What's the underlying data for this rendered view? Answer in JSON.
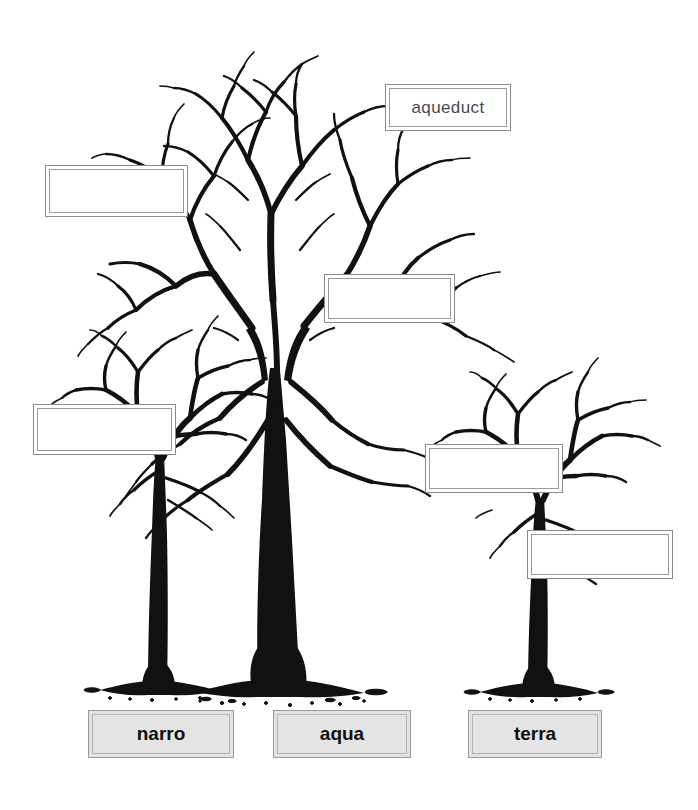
{
  "page": {
    "background_color": "#ffffff",
    "width": 698,
    "height": 810
  },
  "colors": {
    "tree_ink": "#111111",
    "box_border": "#8b8b8b",
    "box_inner_border": "#9a9a9a",
    "box_fill": "#ffffff",
    "root_box_fill": "#e2e2e2",
    "root_box_border": "#9a9a9a",
    "filled_text": "#4a4a4a",
    "root_text": "#101010"
  },
  "trees": [
    {
      "id": "tree-narro",
      "name": "narro-tree",
      "root_word": "narro",
      "size": "small",
      "position": "left"
    },
    {
      "id": "tree-aqua",
      "name": "aqua-tree",
      "root_word": "aqua",
      "size": "large",
      "position": "center"
    },
    {
      "id": "tree-terra",
      "name": "terra-tree",
      "root_word": "terra",
      "size": "small",
      "position": "right"
    }
  ],
  "root_labels": [
    {
      "id": "root-narro",
      "text": "narro",
      "x": 88,
      "y": 710,
      "w": 146,
      "h": 48
    },
    {
      "id": "root-aqua",
      "text": "aqua",
      "x": 273,
      "y": 710,
      "w": 138,
      "h": 48
    },
    {
      "id": "root-terra",
      "text": "terra",
      "x": 468,
      "y": 710,
      "w": 134,
      "h": 48
    }
  ],
  "word_boxes": [
    {
      "id": "word-box-aqueduct",
      "name": "word-box-aqueduct",
      "text": "aqueduct",
      "filled": true,
      "tree": "aqua",
      "x": 385,
      "y": 84,
      "w": 126,
      "h": 47
    },
    {
      "id": "word-box-2",
      "name": "word-box-empty-upper-left",
      "text": "",
      "filled": false,
      "tree": "aqua",
      "x": 45,
      "y": 165,
      "w": 143,
      "h": 52
    },
    {
      "id": "word-box-3",
      "name": "word-box-empty-mid-center",
      "text": "",
      "filled": false,
      "tree": "aqua",
      "x": 324,
      "y": 274,
      "w": 131,
      "h": 49
    },
    {
      "id": "word-box-4",
      "name": "word-box-empty-narro",
      "text": "",
      "filled": false,
      "tree": "narro",
      "x": 33,
      "y": 404,
      "w": 143,
      "h": 51
    },
    {
      "id": "word-box-5",
      "name": "word-box-empty-terra-upper",
      "text": "",
      "filled": false,
      "tree": "terra",
      "x": 425,
      "y": 444,
      "w": 138,
      "h": 49
    },
    {
      "id": "word-box-6",
      "name": "word-box-empty-terra-lower",
      "text": "",
      "filled": false,
      "tree": "terra",
      "x": 527,
      "y": 530,
      "w": 146,
      "h": 49
    }
  ]
}
